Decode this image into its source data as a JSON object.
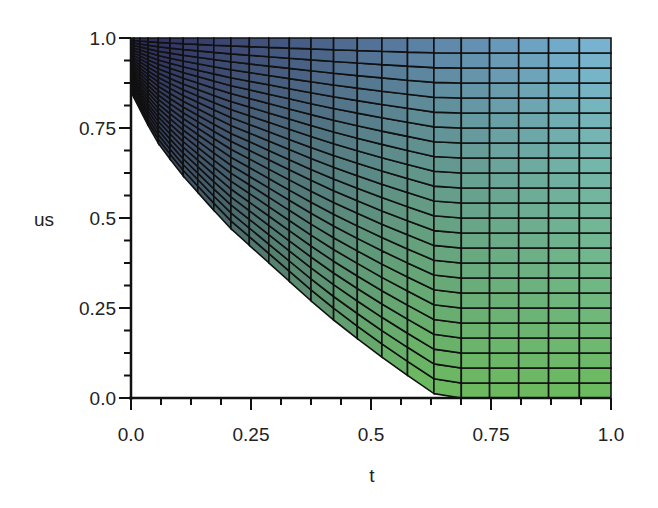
{
  "chart_data": {
    "type": "surface-density-mesh",
    "title": "",
    "xlabel": "t",
    "ylabel": "us",
    "xlim": [
      0.0,
      1.0
    ],
    "ylim": [
      0.0,
      1.0
    ],
    "x_ticks": [
      "0.0",
      "0.25",
      "0.5",
      "0.75",
      "1.0"
    ],
    "y_ticks": [
      "0.0",
      "0.25",
      "0.5",
      "0.75",
      "1.0"
    ],
    "x_tick_values": [
      0.0,
      0.25,
      0.5,
      0.75,
      1.0
    ],
    "y_tick_values": [
      0.0,
      0.25,
      0.5,
      0.75,
      1.0
    ],
    "minor_ticks_per_major": 4,
    "grid": false,
    "legend": null,
    "region_boundary": {
      "description": "Shaded region lies above/right of a convex decreasing curve from (0, 0.85) to (0.645, 0)",
      "points": [
        [
          0.0,
          0.85
        ],
        [
          0.05,
          0.72
        ],
        [
          0.1,
          0.63
        ],
        [
          0.2,
          0.48
        ],
        [
          0.3,
          0.36
        ],
        [
          0.4,
          0.24
        ],
        [
          0.5,
          0.135
        ],
        [
          0.6,
          0.04
        ],
        [
          0.645,
          0.0
        ]
      ]
    },
    "mesh": {
      "columns": 24,
      "rows": 24
    },
    "colormap": {
      "top_left": "#2c2a5a",
      "top_right": "#7ab8d8",
      "bottom_right": "#6cba5e",
      "mid": "#6a7aa8"
    }
  },
  "layout": {
    "plot_left": 131,
    "plot_right": 611,
    "plot_top": 38,
    "plot_bottom": 398
  }
}
